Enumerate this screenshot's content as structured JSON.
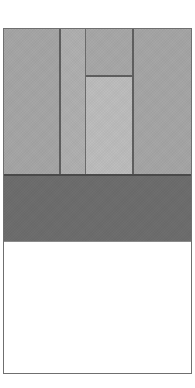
{
  "figure": {
    "background_color": "#ffffff",
    "frame_border_color": "#6f6f6f",
    "bands": [
      {
        "name": "upper-light-band",
        "fill_color": "#a6a6a6",
        "panels": [
          {
            "name": "left-wide-panel",
            "fill_color": "#a6a6a6"
          },
          {
            "name": "narrow-column",
            "fill_color": "#b0b0b0"
          },
          {
            "name": "inner-upper-panel",
            "fill_color": "#a8a8a8"
          },
          {
            "name": "inner-lower-panel",
            "fill_color": "#bdbdbd"
          },
          {
            "name": "right-wide-panel",
            "fill_color": "#a6a6a6"
          }
        ],
        "divider_color": "#5e5e5e"
      },
      {
        "name": "middle-dark-band",
        "fill_color": "#6e6e6e",
        "divider_color": "#4a4a4a"
      },
      {
        "name": "lower-white-band",
        "fill_color": "#ffffff",
        "divider_color": "#8a8a8a"
      }
    ]
  }
}
